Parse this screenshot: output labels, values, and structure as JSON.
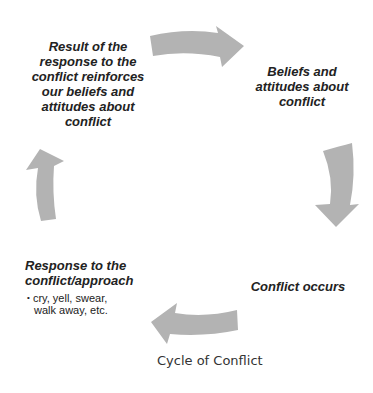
{
  "diagram": {
    "title": "Cycle of Conflict",
    "type": "cycle",
    "arrow_color": "#b3b3b3",
    "text_color": "#222222",
    "nodes": [
      {
        "id": "beliefs",
        "label": "Beliefs and attitudes about conflict",
        "lines": [
          "Beliefs and",
          "attitudes about",
          "conflict"
        ]
      },
      {
        "id": "conflict",
        "label": "Conflict occurs",
        "lines": [
          "Conflict occurs"
        ]
      },
      {
        "id": "response",
        "label": "Response to the conflict/approach",
        "lines": [
          "Response to the",
          "conflict/approach"
        ],
        "bullets": [
          "cry, yell, swear,",
          "walk away, etc."
        ]
      },
      {
        "id": "result",
        "label": "Result of the response to the conflict reinforces our beliefs and attitudes about conflict",
        "lines": [
          "Result of the",
          "response to the",
          "conflict reinforces",
          "our beliefs and",
          "attitudes about",
          "conflict"
        ]
      }
    ],
    "edges": [
      {
        "from": "result",
        "to": "beliefs",
        "direction": "right"
      },
      {
        "from": "beliefs",
        "to": "conflict",
        "direction": "down"
      },
      {
        "from": "conflict",
        "to": "response",
        "direction": "left"
      },
      {
        "from": "response",
        "to": "result",
        "direction": "up"
      }
    ],
    "bullet_char": "•"
  }
}
